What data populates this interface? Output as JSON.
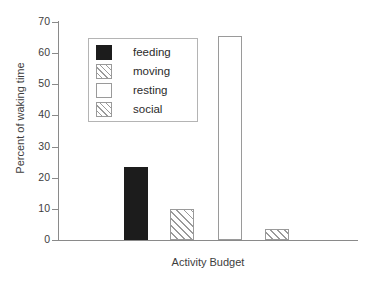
{
  "chart_data": {
    "type": "bar",
    "title": "",
    "subtitle": "",
    "xlabel": "Activity Budget",
    "ylabel": "Percent of waking time",
    "categories": [
      "feeding",
      "moving",
      "resting",
      "social"
    ],
    "values": [
      23.5,
      10,
      65.5,
      3.5
    ],
    "series": [
      {
        "name": "Percent of waking time",
        "values": [
          23.5,
          10,
          65.5,
          3.5
        ]
      }
    ],
    "ylim": [
      0,
      70
    ],
    "xlim": [
      0,
      4
    ],
    "y_ticks": [
      0,
      10,
      20,
      30,
      40,
      50,
      60,
      70
    ],
    "y_tick_labels": [
      "0",
      "10",
      "20",
      "30",
      "40",
      "50",
      "60",
      "70"
    ],
    "x_ticks": [],
    "x_tick_labels": [],
    "grid": false,
    "legend_position": "upper-left-inside",
    "legend": [
      {
        "label": "feeding",
        "fill": "solid-black",
        "swatch_class": "sw-solid",
        "bar_class": "bar-solid"
      },
      {
        "label": "moving",
        "fill": "diagonal-hatch",
        "swatch_class": "sw-hatch",
        "bar_class": "bar-hatch"
      },
      {
        "label": "resting",
        "fill": "empty-white",
        "swatch_class": "sw-empty",
        "bar_class": "bar-empty"
      },
      {
        "label": "social",
        "fill": "diagonal-hatch",
        "swatch_class": "sw-hatch",
        "bar_class": "bar-hatch"
      }
    ],
    "colors": {
      "feeding": "#1c1c1c",
      "moving": "#ffffff",
      "resting": "#ffffff",
      "social": "#ffffff",
      "outline": "#9a9a9a",
      "axis": "#8a8a8a",
      "text": "#3d3d3d",
      "background": "#ffffff"
    },
    "bar_geometry": [
      {
        "left": 66,
        "width": 24
      },
      {
        "left": 112,
        "width": 24
      },
      {
        "left": 160,
        "width": 24
      },
      {
        "left": 207,
        "width": 24
      }
    ]
  }
}
